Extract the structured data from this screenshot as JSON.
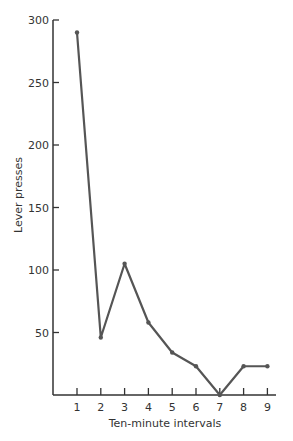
{
  "chart_data": {
    "type": "line",
    "title": "",
    "xlabel": "Ten-minute intervals",
    "ylabel": "Lever presses",
    "x": [
      1,
      2,
      3,
      4,
      5,
      6,
      7,
      8,
      9
    ],
    "series": [
      {
        "name": "Lever presses",
        "values": [
          290,
          46,
          105,
          58,
          34,
          23,
          0,
          23,
          23
        ]
      }
    ],
    "xticks": [
      "1",
      "2",
      "3",
      "4",
      "5",
      "6",
      "7",
      "8",
      "9"
    ],
    "yticks": [
      "50",
      "100",
      "150",
      "200",
      "250",
      "300"
    ],
    "ylim": [
      0,
      300
    ],
    "xlim": [
      0,
      9.3
    ],
    "grid": false,
    "legend": null
  },
  "colors": {
    "line": "#555555",
    "axis": "#333333",
    "text": "#333333"
  }
}
